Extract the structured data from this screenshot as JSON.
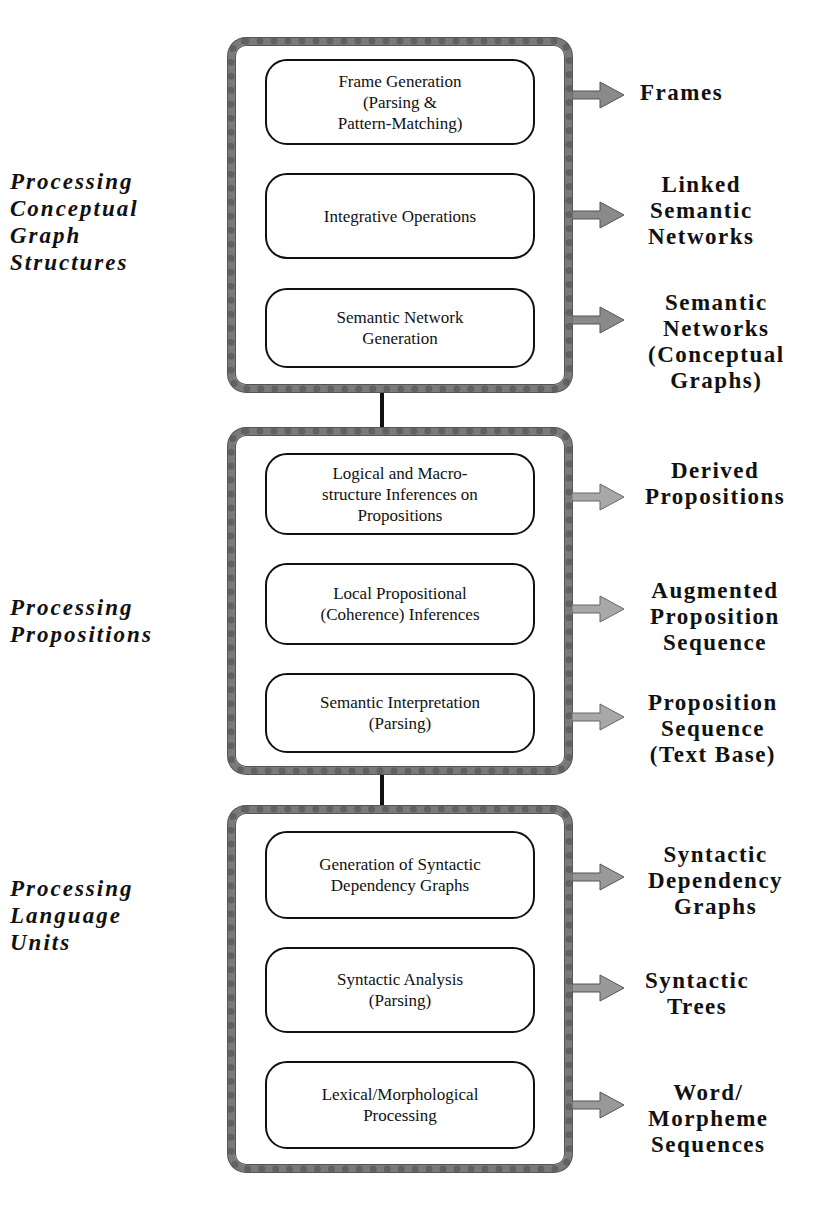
{
  "groups": [
    {
      "label": "Processing\nConceptual\nGraph\nStructures",
      "boxes": [
        "Frame Generation\n(Parsing &\nPattern-Matching)",
        "Integrative Operations",
        "Semantic Network\nGeneration"
      ]
    },
    {
      "label": "Processing\nPropositions",
      "boxes": [
        "Logical and Macro-\nstructure Inferences on\nPropositions",
        "Local Propositional\n(Coherence) Inferences",
        "Semantic Interpretation\n(Parsing)"
      ]
    },
    {
      "label": "Processing\nLanguage\nUnits",
      "boxes": [
        "Generation of Syntactic\nDependency Graphs",
        "Syntactic Analysis\n(Parsing)",
        "Lexical/Morphological\nProcessing"
      ]
    }
  ],
  "outputs": [
    "Frames",
    "Linked\nSemantic\nNetworks",
    "Semantic\nNetworks\n(Conceptual\nGraphs)",
    "Derived\nPropositions",
    "Augmented\nProposition\nSequence",
    "Proposition\nSequence\n(Text  Base)",
    "Syntactic\nDependency\nGraphs",
    "Syntactic\nTrees",
    "Word/\nMorpheme\nSequences"
  ],
  "colors": {
    "frame": "#7a7a7a",
    "arrow": "#9a9a9a",
    "line": "#111111"
  }
}
